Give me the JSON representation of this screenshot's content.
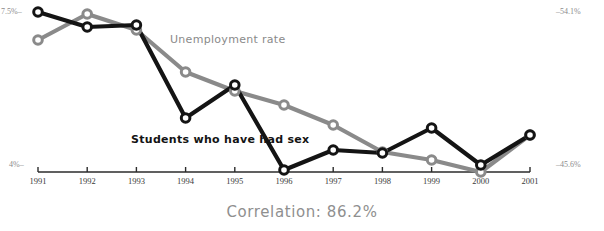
{
  "chart_data": {
    "type": "line",
    "title": "",
    "subtitle": "",
    "xlabel": "",
    "ylabel": "",
    "grid": false,
    "legend_position": "inline-annotation",
    "categories": [
      "1991",
      "1992",
      "1993",
      "1994",
      "1995",
      "1996",
      "1997",
      "1998",
      "1999",
      "2000",
      "2001"
    ],
    "x": [
      1991,
      1992,
      1993,
      1994,
      1995,
      1996,
      1997,
      1998,
      1999,
      2000,
      2001
    ],
    "series": [
      {
        "name": "Students who have had sex",
        "color": "#141414",
        "axis": "right",
        "unit": "%",
        "axis_min": 45.6,
        "axis_max": 54.1,
        "values": [
          54.1,
          52.4,
          52.6,
          41.8,
          45.6,
          35.4,
          37.7,
          37.4,
          39.9,
          35.8,
          39.2
        ],
        "pixel_y": [
          12,
          27,
          25,
          118,
          85,
          170,
          150,
          153,
          128,
          165,
          135
        ]
      },
      {
        "name": "Unemployment rate",
        "color": "#8a8a8a",
        "axis": "left",
        "unit": "%",
        "axis_min": 4.0,
        "axis_max": 7.5,
        "values": [
          6.9,
          7.4,
          7.1,
          6.3,
          6.1,
          5.8,
          5.4,
          4.8,
          4.5,
          4.1,
          5.1
        ],
        "pixel_y": [
          40,
          14,
          30,
          72,
          91,
          105,
          125,
          152,
          160,
          172,
          135
        ]
      }
    ],
    "axes": {
      "left": {
        "top_label": "7.5%",
        "bottom_label": "4%",
        "top_text": "7.5%–",
        "bottom_text": "4%–",
        "range": [
          4.0,
          7.5
        ],
        "series": "Unemployment rate"
      },
      "right": {
        "top_label": "54.1%",
        "bottom_label": "45.6%",
        "top_text": "–54.1%",
        "bottom_text": "–45.6%",
        "range": [
          45.6,
          54.1
        ],
        "series": "Students who have had sex"
      }
    },
    "annotations": [
      {
        "id": "unemployment",
        "text": "Unemployment rate",
        "color": "#8a8a8a"
      },
      {
        "id": "students",
        "text": "Students who have had sex",
        "color": "#141414"
      }
    ],
    "caption": "Correlation: 86.2%",
    "correlation_value": "86.2%"
  },
  "colors": {
    "series_black": "#141414",
    "series_gray": "#8a8a8a",
    "axis_line": "#2b2b2b",
    "tick_label": "#3a3a3a",
    "axis_value_label": "#8c8c8c",
    "caption": "#8f8f8f",
    "marker_fill": "#ffffff",
    "background": "#ffffff"
  },
  "geometry": {
    "width": 604,
    "height": 231,
    "x_first": 38,
    "x_last": 530,
    "x_step": 49.2,
    "baseline_y": 172
  }
}
